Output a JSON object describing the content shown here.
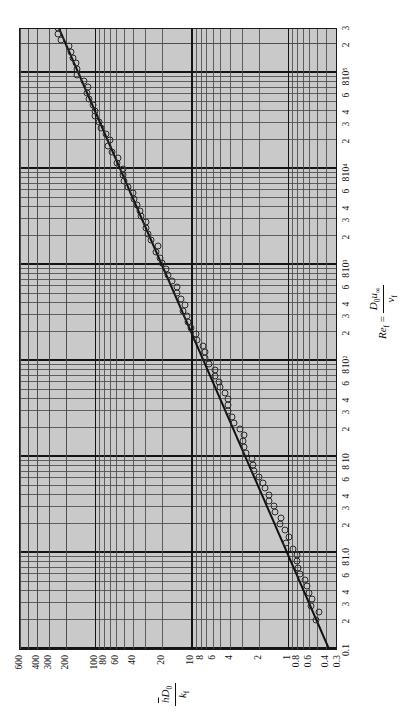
{
  "figure": {
    "caption_present": false,
    "orientation": "rotated-90-landscape-on-portrait-page",
    "background_color": "#c9c9c9",
    "ink_color": "#111111"
  },
  "axes": {
    "x": {
      "title_plain": "Re_f = D_0 u_inf / nu_f",
      "title_lead": "Re",
      "title_lead_sub": "f",
      "title_equals": " = ",
      "num_main": "D",
      "num_sub": "0",
      "num_main2": "u",
      "num_sub2": "∞",
      "den_main": "ν",
      "den_sub": "f",
      "scale": "log",
      "range": [
        0.1,
        300000
      ],
      "tick_labels": [
        "0.1",
        "2",
        "3",
        "4",
        "6",
        "8",
        "1.0",
        "2",
        "3",
        "4",
        "6",
        "8",
        "10",
        "2",
        "3",
        "4",
        "6",
        "8",
        "10²",
        "2",
        "3",
        "4",
        "6",
        "8",
        "10³",
        "2",
        "3",
        "4",
        "6",
        "8",
        "10⁴",
        "2",
        "3",
        "4",
        "6",
        "8",
        "10⁵",
        "2",
        "3"
      ],
      "tick_values": [
        0.1,
        0.2,
        0.3,
        0.4,
        0.6,
        0.8,
        1.0,
        2,
        3,
        4,
        6,
        8,
        10,
        20,
        30,
        40,
        60,
        80,
        100,
        200,
        300,
        400,
        600,
        800,
        1000,
        2000,
        3000,
        4000,
        6000,
        8000,
        10000,
        20000,
        30000,
        40000,
        60000,
        80000,
        100000,
        200000,
        300000
      ]
    },
    "y": {
      "title_plain": "h D_0 / k_f",
      "num_main": "h",
      "num_main_overline": true,
      "num_sub_main": "D",
      "num_sub": "0",
      "den_main": "k",
      "den_sub": "f",
      "scale": "log",
      "range": [
        0.3,
        600
      ],
      "tick_labels": [
        "0.3",
        "0.4",
        "0.6",
        "0.8",
        "1",
        "2",
        "4",
        "6",
        "8",
        "10",
        "20",
        "40",
        "60",
        "80",
        "100",
        "200",
        "300",
        "400",
        "600"
      ],
      "tick_values": [
        0.3,
        0.4,
        0.6,
        0.8,
        1,
        2,
        4,
        6,
        8,
        10,
        20,
        40,
        60,
        80,
        100,
        200,
        300,
        400,
        600
      ]
    }
  },
  "chart_data": {
    "type": "scatter",
    "title": "",
    "subtitle": "",
    "xlabel": "Re_f = D_0 u_inf / nu_f",
    "ylabel": "h D_0 / k_f",
    "xscale": "log",
    "yscale": "log",
    "xlim": [
      0.1,
      300000
    ],
    "ylim": [
      0.3,
      600
    ],
    "grid": true,
    "grid_style": "log-log full minor grid",
    "legend": "none",
    "marker": "open-circle",
    "series": [
      {
        "name": "Experimental data (open circles)",
        "marker": "open-circle",
        "x": [
          0.2,
          0.24,
          0.28,
          0.33,
          0.38,
          0.45,
          0.52,
          0.6,
          0.7,
          0.82,
          0.95,
          1.1,
          1.28,
          1.48,
          1.72,
          2.0,
          2.3,
          2.65,
          3.05,
          3.5,
          4.05,
          4.7,
          5.4,
          6.2,
          7.2,
          8.3,
          9.6,
          11.0,
          12.8,
          14.8,
          17.0,
          19.6,
          22.6,
          26.0,
          30.0,
          34.5,
          40.0,
          46.0,
          53.0,
          61.0,
          70.0,
          81.0,
          93.0,
          108,
          124,
          143,
          165,
          190,
          219,
          252,
          290,
          334,
          385,
          443,
          511,
          588,
          677,
          780,
          898,
          1034,
          1190,
          1371,
          1578,
          1818,
          2093,
          2410,
          2775,
          3196,
          3680,
          4237,
          4879,
          5618,
          6469,
          7449,
          8578,
          9877,
          11373,
          13096,
          15080,
          17364,
          19993,
          23021,
          26508,
          30523,
          35146,
          40469,
          46597,
          53654,
          61779,
          71134,
          81907,
          94312,
          108600,
          125050,
          144000,
          165800,
          190900,
          219800,
          253100,
          291400
        ],
        "y": [
          0.47,
          0.5,
          0.53,
          0.56,
          0.59,
          0.63,
          0.67,
          0.71,
          0.76,
          0.81,
          0.86,
          0.92,
          0.98,
          1.04,
          1.11,
          1.18,
          1.26,
          1.34,
          1.43,
          1.52,
          1.62,
          1.73,
          1.84,
          1.96,
          2.09,
          2.23,
          2.37,
          2.53,
          2.69,
          2.87,
          3.05,
          3.25,
          3.46,
          3.69,
          3.93,
          4.18,
          4.46,
          4.75,
          5.06,
          5.39,
          5.74,
          6.11,
          6.51,
          6.93,
          7.38,
          7.86,
          8.37,
          8.92,
          9.5,
          10.12,
          10.78,
          11.48,
          12.23,
          13.03,
          13.88,
          14.79,
          15.75,
          16.78,
          17.88,
          19.05,
          20.29,
          21.62,
          23.03,
          24.54,
          26.14,
          27.85,
          29.67,
          31.61,
          33.68,
          35.88,
          38.22,
          40.72,
          43.38,
          46.22,
          49.24,
          52.46,
          55.89,
          59.55,
          63.44,
          67.59,
          72.01,
          76.72,
          81.74,
          87.09,
          92.78,
          98.85,
          105.3,
          112.2,
          119.5,
          127.3,
          135.6,
          144.5,
          153.9,
          164.0,
          174.7,
          186.1,
          198.3,
          211.3,
          225.1,
          239.8
        ],
        "point_count": 100
      }
    ],
    "fit_line": {
      "name": "Correlation line",
      "type": "power-law straight line on log-log",
      "x_start": 0.1,
      "y_start": 0.38,
      "x_end": 300000,
      "y_end": 245,
      "description": "single straight line through the scattered data on log-log axes"
    }
  }
}
